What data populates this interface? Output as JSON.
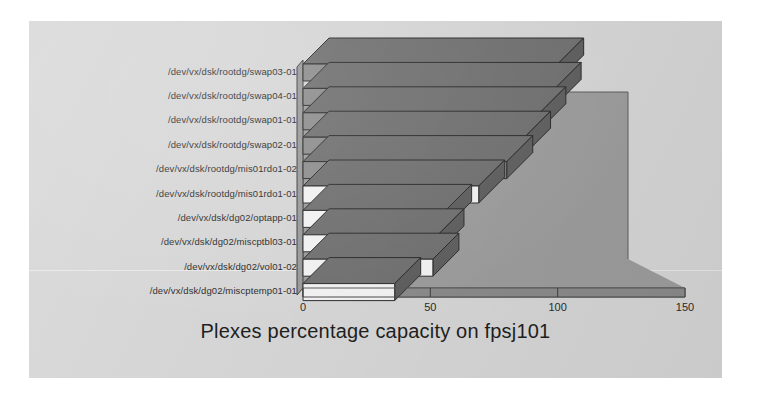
{
  "chart_data": {
    "type": "bar",
    "orientation": "horizontal",
    "style": "3d",
    "title": "Plexes percentage capacity on fpsj101",
    "xlabel": "",
    "ylabel": "",
    "xlim": [
      0,
      150
    ],
    "xticks": [
      0,
      50,
      100,
      150
    ],
    "xticklabels": [
      "0",
      "50",
      "100",
      "150"
    ],
    "grid": false,
    "legend": false,
    "categories": [
      "/dev/vx/dsk/rootdg/swap03-01",
      "/dev/vx/dsk/rootdg/swap04-01",
      "/dev/vx/dsk/rootdg/swap01-01",
      "/dev/vx/dsk/rootdg/swap02-01",
      "/dev/vx/dsk/rootdg/mis01rdo1-02",
      "/dev/vx/dsk/rootdg/mis01rdo1-01",
      "/dev/vx/dsk/dg02/optapp-01",
      "/dev/vx/dsk/dg02/miscptbl03-01",
      "/dev/vx/dsk/dg02/vol01-02",
      "/dev/vx/dsk/dg02/miscptemp01-01"
    ],
    "values": [
      100,
      99,
      93,
      87,
      80,
      69,
      56,
      53,
      51,
      36
    ],
    "bar_fill_colors": [
      "#8d8d8d",
      "#8d8d8d",
      "#8d8d8d",
      "#8d8d8d",
      "#8d8d8d",
      "#f2f2f2",
      "#f2f2f2",
      "#f2f2f2",
      "#f2f2f2",
      "#f2f2f2"
    ]
  },
  "chart": {
    "title": "Plexes percentage capacity on fpsj101",
    "axis": {
      "ticks": [
        {
          "label": "0",
          "value": 0
        },
        {
          "label": "50",
          "value": 50
        },
        {
          "label": "100",
          "value": 100
        },
        {
          "label": "150",
          "value": 150
        }
      ]
    },
    "category_labels": [
      "/dev/vx/dsk/rootdg/swap03-01",
      "/dev/vx/dsk/rootdg/swap04-01",
      "/dev/vx/dsk/rootdg/swap01-01",
      "/dev/vx/dsk/rootdg/swap02-01",
      "/dev/vx/dsk/rootdg/mis01rdo1-02",
      "/dev/vx/dsk/rootdg/mis01rdo1-01",
      "/dev/vx/dsk/dg02/optapp-01",
      "/dev/vx/dsk/dg02/miscptbl03-01",
      "/dev/vx/dsk/dg02/vol01-02",
      "/dev/vx/dsk/dg02/miscptemp01-01"
    ],
    "colors": {
      "panel_background": "#d5d5d5",
      "wall": "#9c9c9c",
      "floor": "#8f8f8f",
      "floor_edge": "#7a7a7a",
      "bar_dark": "#8d8d8d",
      "bar_light": "#f2f2f2",
      "bar_side": "#5e5e5e",
      "bar_top": "#707070",
      "outline": "#2b2b2b",
      "text": "#2a2a2a"
    }
  }
}
